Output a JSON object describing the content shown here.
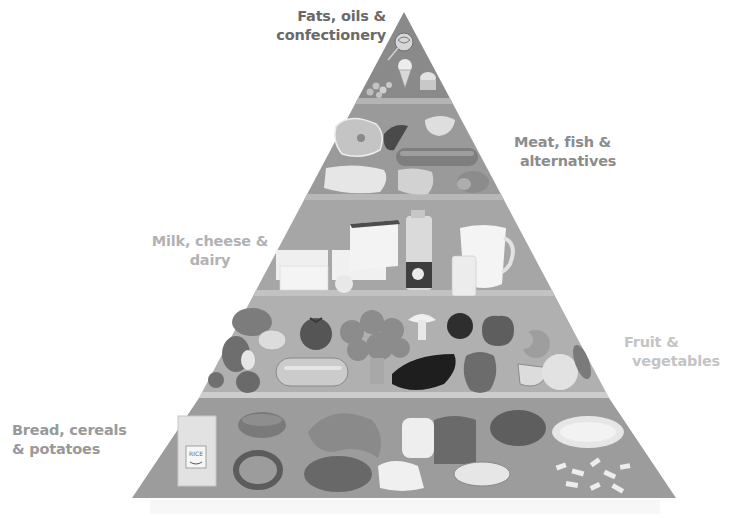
{
  "diagram": {
    "type": "food-pyramid",
    "tiers": [
      {
        "id": "fats",
        "label_line1": "Fats, oils &",
        "label_line2": "confectionery",
        "label_side": "left",
        "fill": "#8a8a8a",
        "items": [
          "lollipop",
          "ice-cream-cone",
          "cupcake",
          "sweets"
        ]
      },
      {
        "id": "meat",
        "label_line1": "Meat, fish &",
        "label_line2": "alternatives",
        "label_side": "right",
        "fill": "#9a9a9a",
        "items": [
          "ham",
          "chicken-drumstick",
          "bread-roll",
          "sausage",
          "fish-fillet",
          "steak",
          "meat-roll"
        ]
      },
      {
        "id": "milk",
        "label_line1": "Milk, cheese &",
        "label_line2": "dairy",
        "label_side": "left",
        "fill": "#a6a6a6",
        "items": [
          "cheese-block",
          "cheese-wedge",
          "butter",
          "milk-bottle",
          "milk-jug",
          "glass-of-milk"
        ]
      },
      {
        "id": "fruit",
        "label_line1": "Fruit &",
        "label_line2": "vegetables",
        "label_side": "right",
        "fill": "#b0b0b0",
        "items": [
          "potato",
          "mushrooms",
          "tomato",
          "broccoli",
          "mushroom",
          "plum",
          "apple",
          "onion",
          "raspberry",
          "strawberry",
          "cucumber",
          "eggplant",
          "pepper",
          "orange",
          "lemon"
        ]
      },
      {
        "id": "bread",
        "label_line1": "Bread, cereals",
        "label_line2": "& potatoes",
        "label_side": "left",
        "fill": "#9c9c9c",
        "items": [
          "rice-bag",
          "bread-loaf-round",
          "croissant",
          "sliced-bread",
          "pretzel",
          "bun",
          "baguette",
          "potato",
          "grated-cheese",
          "pasta"
        ]
      }
    ],
    "rice_bag_text": "RICE"
  }
}
